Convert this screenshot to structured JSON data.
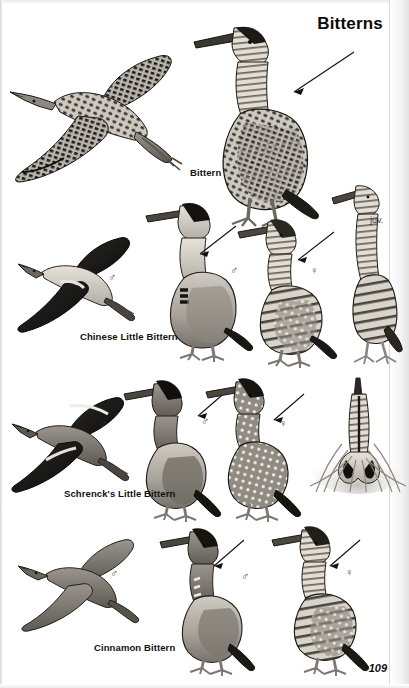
{
  "page": {
    "title": "Bitterns",
    "page_number": "109",
    "background_color": "#ffffff",
    "ink_color": "#111111",
    "width": 409,
    "height": 688
  },
  "species": [
    {
      "id": "bittern",
      "label": "Bittern",
      "label_pos": {
        "x": 190,
        "y": 168
      },
      "figures": [
        {
          "name": "bittern-flight",
          "pose": "flight",
          "sex": "",
          "x": 8,
          "y": 48,
          "w": 175,
          "h": 130
        },
        {
          "name": "bittern-standing",
          "pose": "standing",
          "sex": "",
          "x": 185,
          "y": 20,
          "w": 135,
          "h": 200
        }
      ],
      "arrows": [
        {
          "name": "arrow-bittern-standing",
          "x1": 352,
          "y1": 52,
          "x2": 291,
          "y2": 92
        }
      ]
    },
    {
      "id": "chinese-little-bittern",
      "label": "Chinese Little Bittern",
      "label_pos": {
        "x": 80,
        "y": 332
      },
      "figures": [
        {
          "name": "chinese-little-bittern-flight-male",
          "pose": "flight",
          "sex": "♂",
          "x": 18,
          "y": 238,
          "w": 120,
          "h": 95
        },
        {
          "name": "chinese-little-bittern-standing-male",
          "pose": "standing",
          "sex": "♂",
          "x": 146,
          "y": 200,
          "w": 105,
          "h": 155
        },
        {
          "name": "chinese-little-bittern-standing-female",
          "pose": "standing",
          "sex": "♀",
          "x": 238,
          "y": 218,
          "w": 95,
          "h": 140
        },
        {
          "name": "chinese-little-bittern-juvenile",
          "pose": "standing",
          "sex": "juv.",
          "x": 330,
          "y": 182,
          "w": 70,
          "h": 180
        }
      ],
      "sex_marks": [
        {
          "name": "sex-male-flight",
          "symbol": "♂",
          "x": 111,
          "y": 279
        },
        {
          "name": "sex-male-standing",
          "symbol": "♂",
          "x": 232,
          "y": 270
        },
        {
          "name": "sex-female-standing",
          "symbol": "♀",
          "x": 312,
          "y": 270
        }
      ],
      "age_marks": [
        {
          "name": "age-juvenile",
          "text": "juv.",
          "x": 372,
          "y": 218
        }
      ],
      "arrows": [
        {
          "name": "arrow-cbl-male",
          "x1": 232,
          "y1": 226,
          "x2": 199,
          "y2": 253
        },
        {
          "name": "arrow-cbl-female",
          "x1": 330,
          "y1": 232,
          "x2": 299,
          "y2": 258
        }
      ]
    },
    {
      "id": "schrencks-little-bittern",
      "label": "Schrenck's Little Bittern",
      "label_pos": {
        "x": 64,
        "y": 489
      },
      "figures": [
        {
          "name": "schrencks-flight-male",
          "pose": "flight",
          "sex": "♂",
          "x": 14,
          "y": 398,
          "w": 120,
          "h": 95
        },
        {
          "name": "schrencks-standing-male",
          "pose": "standing",
          "sex": "♂",
          "x": 124,
          "y": 380,
          "w": 100,
          "h": 135
        },
        {
          "name": "schrencks-standing-female",
          "pose": "standing",
          "sex": "♀",
          "x": 206,
          "y": 376,
          "w": 100,
          "h": 140
        },
        {
          "name": "schrencks-reed-posture",
          "pose": "reed-bittern",
          "sex": "",
          "x": 312,
          "y": 376,
          "w": 92,
          "h": 115
        }
      ],
      "sex_marks": [
        {
          "name": "sex-male-flight",
          "symbol": "♂",
          "x": 101,
          "y": 426
        },
        {
          "name": "sex-male-standing",
          "symbol": "♂",
          "x": 203,
          "y": 422
        },
        {
          "name": "sex-female-standing",
          "symbol": "♀",
          "x": 281,
          "y": 424
        }
      ],
      "arrows": [
        {
          "name": "arrow-schrencks-male",
          "x1": 224,
          "y1": 392,
          "x2": 196,
          "y2": 414
        },
        {
          "name": "arrow-schrencks-female",
          "x1": 300,
          "y1": 396,
          "x2": 272,
          "y2": 420
        }
      ]
    },
    {
      "id": "cinnamon-bittern",
      "label": "Cinnamon Bittern",
      "label_pos": {
        "x": 94,
        "y": 643
      },
      "figures": [
        {
          "name": "cinnamon-flight-male",
          "pose": "flight",
          "sex": "♂",
          "x": 18,
          "y": 536,
          "w": 125,
          "h": 90
        },
        {
          "name": "cinnamon-standing-male",
          "pose": "standing",
          "sex": "♂",
          "x": 160,
          "y": 528,
          "w": 100,
          "h": 140
        },
        {
          "name": "cinnamon-standing-female",
          "pose": "standing",
          "sex": "♀",
          "x": 272,
          "y": 524,
          "w": 100,
          "h": 145
        }
      ],
      "sex_marks": [
        {
          "name": "sex-male-flight",
          "symbol": "♂",
          "x": 112,
          "y": 574
        },
        {
          "name": "sex-male-standing",
          "symbol": "♂",
          "x": 243,
          "y": 577
        },
        {
          "name": "sex-female-standing",
          "symbol": "♀",
          "x": 347,
          "y": 573
        }
      ],
      "arrows": [
        {
          "name": "arrow-cinnamon-male",
          "x1": 243,
          "y1": 540,
          "x2": 214,
          "y2": 566
        },
        {
          "name": "arrow-cinnamon-female",
          "x1": 360,
          "y1": 540,
          "x2": 330,
          "y2": 566
        }
      ]
    }
  ]
}
